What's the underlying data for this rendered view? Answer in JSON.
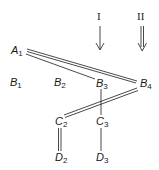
{
  "diagram": {
    "arrows": [
      {
        "label": "I",
        "style": "single"
      },
      {
        "label": "II",
        "style": "double"
      }
    ],
    "nodes": {
      "A1": {
        "base": "A",
        "sub": "1"
      },
      "B1": {
        "base": "B",
        "sub": "1"
      },
      "B2": {
        "base": "B",
        "sub": "2"
      },
      "B3": {
        "base": "B",
        "sub": "3"
      },
      "B4": {
        "base": "B",
        "sub": "4"
      },
      "C2": {
        "base": "C",
        "sub": "2"
      },
      "C3": {
        "base": "C",
        "sub": "3"
      },
      "D2": {
        "base": "D",
        "sub": "2"
      },
      "D3": {
        "base": "D",
        "sub": "3"
      }
    },
    "edges": [
      {
        "from": "A1",
        "to": "B4",
        "style": "double"
      },
      {
        "from": "A1",
        "to": "B3",
        "style": "single"
      },
      {
        "from": "B4",
        "to": "C2",
        "style": "double"
      },
      {
        "from": "B3",
        "to": "C3",
        "style": "single"
      },
      {
        "from": "C2",
        "to": "D2",
        "style": "double"
      },
      {
        "from": "C3",
        "to": "D3",
        "style": "single"
      }
    ],
    "colors": {
      "ink": "#1a1a1a",
      "background": "#ffffff"
    }
  }
}
